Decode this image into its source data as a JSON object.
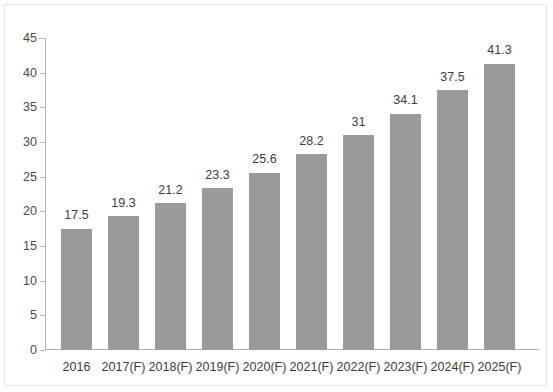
{
  "chart_data": {
    "type": "bar",
    "title": "",
    "subtitle": "",
    "xlabel": "",
    "ylabel": "",
    "ylim": [
      0,
      45
    ],
    "ytick_step": 5,
    "yticks": [
      0,
      5,
      10,
      15,
      20,
      25,
      30,
      35,
      40,
      45
    ],
    "ytick_labels": [
      "0",
      "5",
      "10",
      "15",
      "20",
      "25",
      "30",
      "35",
      "40",
      "45"
    ],
    "grid": false,
    "legend": null,
    "categories": [
      "2016",
      "2017(F)",
      "2018(F)",
      "2019(F)",
      "2020(F)",
      "2021(F)",
      "2022(F)",
      "2023(F)",
      "2024(F)",
      "2025(F)"
    ],
    "values": [
      17.5,
      19.3,
      21.2,
      23.3,
      25.6,
      28.2,
      31,
      34.1,
      37.5,
      41.3
    ],
    "data_labels": [
      "17.5",
      "19.3",
      "21.2",
      "23.3",
      "25.6",
      "28.2",
      "31",
      "34.1",
      "37.5",
      "41.3"
    ],
    "bar_color": "#9a9a9a",
    "axis_color": "#b0b0b0",
    "text_color": "#3d3d3d",
    "background_color": "#ffffff",
    "border_color": "#e3e3e3"
  }
}
